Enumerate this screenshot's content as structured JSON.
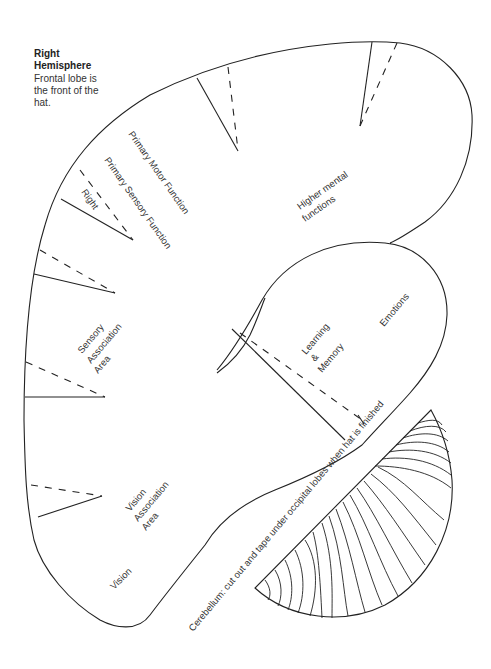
{
  "title": {
    "line1": "Right",
    "line2": "Hemisphere",
    "description_lines": [
      "Frontal lobe is",
      "the front of the",
      "hat."
    ]
  },
  "regions": {
    "primary_motor": "Primary Motor Function",
    "primary_sensory": "Primary Sensory Function",
    "right": "Right",
    "higher_mental": [
      "Higher mental",
      "functions"
    ],
    "sensory_association": [
      "Sensory",
      "Association",
      "Area"
    ],
    "learning_memory": [
      "Learning",
      "&",
      "Memory"
    ],
    "emotions": "Emotions",
    "vision_association": [
      "Vision",
      "Association",
      "Area"
    ],
    "vision": "Vision",
    "cerebellum_instruction": "Cerebellum: cut out and tape under occipital lobes when hat is finished"
  },
  "colors": {
    "stroke": "#222222",
    "text": "#333333",
    "background": "#ffffff"
  }
}
